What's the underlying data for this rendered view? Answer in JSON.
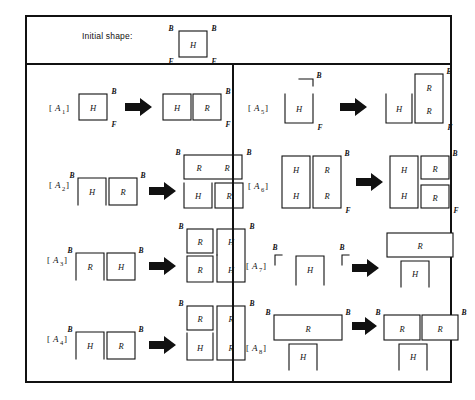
{
  "figure": {
    "header": {
      "label": "Initial shape:",
      "shape": {
        "cell": "H",
        "corner_labels": {
          "top_left": "B",
          "top_right": "B",
          "bottom_left": "F",
          "bottom_right": "F"
        }
      }
    },
    "rules": [
      {
        "id": "A1",
        "tag_open": "[",
        "tag_close": "]",
        "tag_base": "A",
        "tag_sub": "1",
        "column": "left",
        "lhs": {
          "cells": [
            "H"
          ],
          "labels": [
            "B",
            "F"
          ]
        },
        "rhs": {
          "cells": [
            "H",
            "R"
          ],
          "labels": [
            "B",
            "F"
          ]
        }
      },
      {
        "id": "A2",
        "tag_open": "[",
        "tag_close": "]",
        "tag_base": "A",
        "tag_sub": "2",
        "column": "left",
        "lhs": {
          "cells": [
            "H",
            "R"
          ],
          "labels": [
            "B",
            "B"
          ]
        },
        "rhs": {
          "cells": [
            "R",
            "R",
            "H",
            "R"
          ],
          "labels": [
            "B",
            "B"
          ]
        }
      },
      {
        "id": "A3",
        "tag_open": "[",
        "tag_close": "]",
        "tag_base": "A",
        "tag_sub": "3",
        "column": "left",
        "lhs": {
          "cells": [
            "R",
            "H"
          ],
          "labels": [
            "B",
            "B"
          ]
        },
        "rhs": {
          "cells": [
            "R",
            "H",
            "R",
            "H"
          ],
          "labels": [
            "B",
            "B"
          ]
        }
      },
      {
        "id": "A4",
        "tag_open": "[",
        "tag_close": "]",
        "tag_base": "A",
        "tag_sub": "4",
        "column": "left",
        "lhs": {
          "cells": [
            "H",
            "R"
          ],
          "labels": [
            "B",
            "B"
          ]
        },
        "rhs": {
          "cells": [
            "R",
            "R",
            "H",
            "R"
          ],
          "labels": [
            "B",
            "B"
          ]
        }
      },
      {
        "id": "A5",
        "tag_open": "[",
        "tag_close": "]",
        "tag_base": "A",
        "tag_sub": "5",
        "column": "right",
        "lhs": {
          "cells": [
            "H"
          ],
          "labels": [
            "B",
            "F"
          ]
        },
        "rhs": {
          "cells": [
            "R",
            "H",
            "R"
          ],
          "labels": [
            "B",
            "F"
          ]
        }
      },
      {
        "id": "A6",
        "tag_open": "[",
        "tag_close": "]",
        "tag_base": "A",
        "tag_sub": "6",
        "column": "right",
        "lhs": {
          "cells": [
            "H",
            "R",
            "H",
            "R"
          ],
          "labels": [
            "B",
            "F"
          ]
        },
        "rhs": {
          "cells": [
            "H",
            "R",
            "H",
            "R"
          ],
          "labels": [
            "B",
            "F"
          ]
        }
      },
      {
        "id": "A7",
        "tag_open": "[",
        "tag_close": "]",
        "tag_base": "A",
        "tag_sub": "7",
        "column": "right",
        "lhs": {
          "cells": [
            "H"
          ],
          "labels": [
            "B",
            "B"
          ]
        },
        "rhs": {
          "cells": [
            "R",
            "H"
          ],
          "labels": []
        }
      },
      {
        "id": "A8",
        "tag_open": "[",
        "tag_close": "]",
        "tag_base": "A",
        "tag_sub": "8",
        "column": "right",
        "lhs": {
          "cells": [
            "R",
            "H"
          ],
          "labels": [
            "B",
            "B"
          ]
        },
        "rhs": {
          "cells": [
            "R",
            "R",
            "H"
          ],
          "labels": [
            "B",
            "B",
            "B"
          ]
        }
      }
    ],
    "glyphs": {
      "H": "H",
      "R": "R",
      "B": "B",
      "F": "F",
      "corner_not": "¬",
      "corner_gamma": "Γ"
    },
    "colors": {
      "ink": "#111111",
      "paper": "#ffffff"
    }
  }
}
